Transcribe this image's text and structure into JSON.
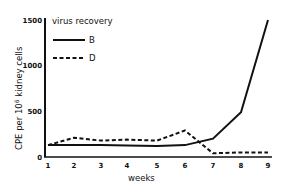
{
  "chart_data": {
    "type": "line",
    "title": "",
    "xlabel": "weeks",
    "ylabel": "CPE per 10^6 kidney cells",
    "ylabel_parts": {
      "pre": "CPE per 10",
      "sup": "6",
      "post": " kidney cells"
    },
    "x": [
      1,
      2,
      3,
      4,
      5,
      6,
      7,
      8,
      9
    ],
    "x_ticks": [
      "1",
      "2",
      "3",
      "4",
      "5",
      "6",
      "7",
      "8",
      "9"
    ],
    "y_ticks": [
      "0",
      "500",
      "1000",
      "1500"
    ],
    "ylim": [
      0,
      1500
    ],
    "xlim": [
      1,
      9
    ],
    "legend_title": "virus recovery",
    "legend_position": "upper left",
    "grid": false,
    "series": [
      {
        "name": "B",
        "style": "solid",
        "values": [
          130,
          130,
          130,
          125,
          120,
          130,
          200,
          490,
          1500
        ]
      },
      {
        "name": "D",
        "style": "dashed",
        "values": [
          130,
          210,
          180,
          190,
          180,
          290,
          40,
          50,
          50
        ]
      }
    ]
  }
}
